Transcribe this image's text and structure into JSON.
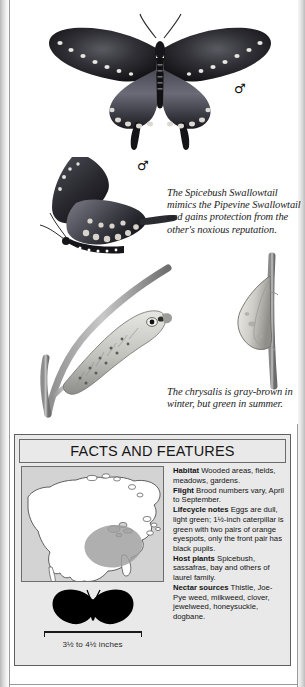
{
  "page": {
    "subject": "Spicebush Swallowtail",
    "captions": {
      "mimicry": "The Spicebush Swallowtail mimics the Pipevine Swallowtail and gains protection from the other's noxious reputation.",
      "chrysalis": "The chrysalis is gray-brown in winter, but green in summer."
    },
    "sex_symbols": {
      "dorsal": "♂",
      "lateral": "♂"
    }
  },
  "facts_box": {
    "title": "FACTS AND FEATURES",
    "scale_label": "3½ to 4½ inches",
    "entries": [
      {
        "label": "Habitat",
        "text": "Wooded areas, fields, meadows, gardens."
      },
      {
        "label": "Flight",
        "text": "Brood numbers vary, April to September."
      },
      {
        "label": "Lifecycle notes",
        "text": "Eggs are dull, light green; 1½-inch caterpillar is green with two pairs of orange eyespots, only the front pair has black pupils."
      },
      {
        "label": "Host plants",
        "text": "Spicebush, sassafras, bay and others of laurel family."
      },
      {
        "label": "Nectar sources",
        "text": "Thistle, Joe-Pye weed, milkweed, clover, jewelweed, honeysuckle, dogbane."
      }
    ]
  },
  "colors": {
    "page_background": "#ffffff",
    "facts_box_fill": "#e9e9e9",
    "facts_box_border": "#5f5f5f",
    "map_fill": "#d3d3d3",
    "map_land": "#ffffff",
    "map_range_shading": "#9d9d9d",
    "silhouette": "#000000",
    "text": "#131313"
  }
}
